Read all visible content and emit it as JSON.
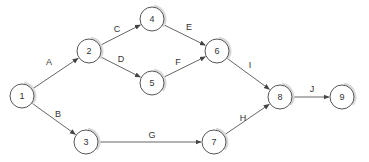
{
  "diagram": {
    "type": "activity-on-arrow network",
    "colors": {
      "stroke": "#555555",
      "text": "#333333",
      "shadow": "#d8d8d8",
      "background": "#ffffff"
    },
    "nodes": [
      {
        "id": "1",
        "label": "1",
        "x": 22,
        "y": 96
      },
      {
        "id": "2",
        "label": "2",
        "x": 89,
        "y": 51
      },
      {
        "id": "3",
        "label": "3",
        "x": 86,
        "y": 142
      },
      {
        "id": "4",
        "label": "4",
        "x": 152,
        "y": 19
      },
      {
        "id": "5",
        "label": "5",
        "x": 152,
        "y": 83
      },
      {
        "id": "6",
        "label": "6",
        "x": 217,
        "y": 51
      },
      {
        "id": "7",
        "label": "7",
        "x": 214,
        "y": 142
      },
      {
        "id": "8",
        "label": "8",
        "x": 280,
        "y": 97
      },
      {
        "id": "9",
        "label": "9",
        "x": 342,
        "y": 97
      }
    ],
    "edges": [
      {
        "label": "A",
        "from": "1",
        "to": "2",
        "lx": 49,
        "ly": 62
      },
      {
        "label": "B",
        "from": "1",
        "to": "3",
        "lx": 58,
        "ly": 114
      },
      {
        "label": "C",
        "from": "2",
        "to": "4",
        "lx": 117,
        "ly": 29
      },
      {
        "label": "D",
        "from": "2",
        "to": "5",
        "lx": 121,
        "ly": 59
      },
      {
        "label": "E",
        "from": "4",
        "to": "6",
        "lx": 189,
        "ly": 27
      },
      {
        "label": "F",
        "from": "5",
        "to": "6",
        "lx": 178,
        "ly": 62
      },
      {
        "label": "G",
        "from": "3",
        "to": "7",
        "lx": 152,
        "ly": 135
      },
      {
        "label": "H",
        "from": "7",
        "to": "8",
        "lx": 243,
        "ly": 118
      },
      {
        "label": "I",
        "from": "6",
        "to": "8",
        "lx": 250,
        "ly": 65
      },
      {
        "label": "J",
        "from": "8",
        "to": "9",
        "lx": 312,
        "ly": 89
      }
    ],
    "node_radius": 12
  }
}
